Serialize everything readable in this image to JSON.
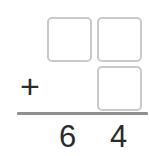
{
  "worksheet": {
    "type": "vertical-addition-problem",
    "operator": "+",
    "input_boxes": [
      {
        "name": "addend1-tens",
        "value": "",
        "placeholder": ""
      },
      {
        "name": "addend1-ones",
        "value": "",
        "placeholder": ""
      },
      {
        "name": "addend2-ones",
        "value": "",
        "placeholder": ""
      }
    ],
    "sum": {
      "tens": "6",
      "ones": "4",
      "full": "64"
    },
    "colors": {
      "background": "#ffffff",
      "box_border": "#c9c9c9",
      "rule": "#8f8f8f",
      "text": "#2b2b2b"
    }
  }
}
